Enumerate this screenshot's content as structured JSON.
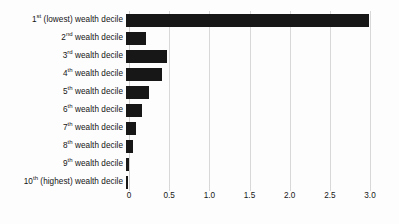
{
  "chart_data": {
    "type": "bar",
    "orientation": "horizontal",
    "title": "",
    "xlabel": "",
    "ylabel": "",
    "categories": [
      "1st (lowest) wealth decile",
      "2nd wealth decile",
      "3rd wealth decile",
      "4th wealth decile",
      "5th wealth decile",
      "6th wealth decile",
      "7th wealth decile",
      "8th wealth decile",
      "9th wealth decile",
      "10th (highest) wealth decile"
    ],
    "category_parts": [
      {
        "num": "1",
        "sup": "st",
        "rest": " (lowest) wealth decile"
      },
      {
        "num": "2",
        "sup": "nd",
        "rest": " wealth decile"
      },
      {
        "num": "3",
        "sup": "rd",
        "rest": " wealth decile"
      },
      {
        "num": "4",
        "sup": "th",
        "rest": " wealth decile"
      },
      {
        "num": "5",
        "sup": "th",
        "rest": " wealth decile"
      },
      {
        "num": "6",
        "sup": "th",
        "rest": " wealth decile"
      },
      {
        "num": "7",
        "sup": "th",
        "rest": " wealth decile"
      },
      {
        "num": "8",
        "sup": "th",
        "rest": " wealth decile"
      },
      {
        "num": "9",
        "sup": "th",
        "rest": " wealth decile"
      },
      {
        "num": "10",
        "sup": "th",
        "rest": " (highest) wealth decile"
      }
    ],
    "values": [
      3.02,
      0.25,
      0.51,
      0.45,
      0.29,
      0.2,
      0.12,
      0.09,
      0.04,
      0.03
    ],
    "xlim": [
      0,
      3.0
    ],
    "xticks": [
      0,
      0.5,
      1.0,
      1.5,
      2.0,
      2.5,
      3.0
    ],
    "xtick_labels": [
      "0",
      "0.5",
      "1.0",
      "1.5",
      "2.0",
      "2.5",
      "3.0"
    ],
    "grid": true,
    "legend": false,
    "bar_color": "#171717",
    "grid_color": "#d8d8d8",
    "background_color": "#fdfdfd"
  }
}
